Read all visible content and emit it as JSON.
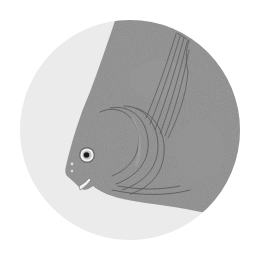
{
  "image": {
    "subject": "fish illustration",
    "description": "Stylized grey fish head with eye, dorsal fin lines and gill arcs inside a circular light-grey frame",
    "colors": {
      "background": "#ffffff",
      "circle": "#ebebeb",
      "fish_body": "#8e8e8e",
      "fish_lines": "#5a5a5a",
      "eye_white": "#f2f2f2",
      "pupil": "#1a1a1a"
    }
  }
}
